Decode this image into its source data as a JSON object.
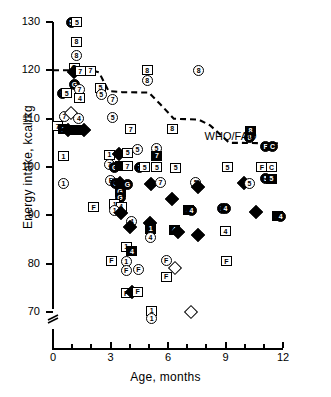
{
  "chart_data": {
    "type": "scatter",
    "title": "",
    "xlabel": "Age, months",
    "ylabel": "Energy intake, kcal/kg",
    "xlim": [
      0,
      12
    ],
    "ylim": [
      66,
      130
    ],
    "grid": false,
    "axis_break_y": true,
    "x_ticks_major": [
      0,
      3,
      6,
      9,
      12
    ],
    "x_ticks_minor": [
      1,
      2,
      4,
      5,
      7,
      8,
      10,
      11
    ],
    "y_ticks": [
      70,
      80,
      90,
      100,
      110,
      120,
      130
    ],
    "x_tick_labels": [
      "0",
      "3",
      "6",
      "9",
      "12"
    ],
    "y_tick_labels": [
      "70",
      "80",
      "90",
      "100",
      "110",
      "120",
      "130"
    ],
    "annotations": [
      {
        "text": "WHO/FAO",
        "x": 10.1,
        "y": 106.2
      }
    ],
    "reference_line": {
      "name": "WHO/FAO",
      "style": "dashed",
      "points": [
        [
          0.0,
          120.0
        ],
        [
          2.0,
          120.0
        ],
        [
          2.4,
          119.6
        ],
        [
          2.9,
          115.7
        ],
        [
          3.6,
          115.5
        ],
        [
          5.0,
          115.4
        ],
        [
          5.6,
          113.0
        ],
        [
          6.3,
          110.0
        ],
        [
          7.6,
          109.8
        ],
        [
          8.2,
          108.6
        ],
        [
          9.2,
          105.0
        ],
        [
          11.9,
          104.9
        ]
      ]
    },
    "marker_shapes": {
      "sq": "square",
      "ci": "circle",
      "di": "diamond"
    },
    "points": [
      {
        "x": 0.95,
        "y": 129.8,
        "shape": "ci",
        "label": "5",
        "filled": true
      },
      {
        "x": 1.25,
        "y": 129.9,
        "shape": "sq",
        "label": "5"
      },
      {
        "x": 1.22,
        "y": 125.9,
        "shape": "sq",
        "label": "8"
      },
      {
        "x": 1.22,
        "y": 123.0,
        "shape": "ci",
        "label": "8"
      },
      {
        "x": 1.1,
        "y": 120.5,
        "shape": "sq",
        "label": "G"
      },
      {
        "x": 1.12,
        "y": 119.7,
        "shape": "di",
        "label": "",
        "filled": true
      },
      {
        "x": 1.42,
        "y": 119.8,
        "shape": "sq",
        "label": "7"
      },
      {
        "x": 1.95,
        "y": 119.9,
        "shape": "sq",
        "label": "7"
      },
      {
        "x": 1.12,
        "y": 117.0,
        "shape": "ci",
        "label": "G",
        "filled": true
      },
      {
        "x": 0.5,
        "y": 115.3,
        "shape": "ci",
        "label": "5",
        "filled": true
      },
      {
        "x": 0.72,
        "y": 115.3,
        "shape": "sq",
        "label": "5"
      },
      {
        "x": 1.38,
        "y": 116.1,
        "shape": "ci",
        "label": "7"
      },
      {
        "x": 2.48,
        "y": 116.4,
        "shape": "sq",
        "label": "5"
      },
      {
        "x": 2.52,
        "y": 115.1,
        "shape": "ci",
        "label": "5"
      },
      {
        "x": 1.4,
        "y": 114.2,
        "shape": "sq",
        "label": "4"
      },
      {
        "x": 3.12,
        "y": 114.0,
        "shape": "ci",
        "label": "7"
      },
      {
        "x": 0.6,
        "y": 110.4,
        "shape": "ci",
        "label": "7"
      },
      {
        "x": 0.92,
        "y": 111.2,
        "shape": "di",
        "label": "",
        "filled": false
      },
      {
        "x": 3.12,
        "y": 110.3,
        "shape": "ci",
        "label": "5"
      },
      {
        "x": 1.35,
        "y": 110.1,
        "shape": "ci",
        "label": "4"
      },
      {
        "x": 0.25,
        "y": 108.4,
        "shape": "sq",
        "label": "7"
      },
      {
        "x": 0.55,
        "y": 107.8,
        "shape": "sq",
        "label": "1",
        "filled": true
      },
      {
        "x": 0.78,
        "y": 107.7,
        "shape": "di",
        "label": "",
        "filled": true
      },
      {
        "x": 1.05,
        "y": 107.6,
        "shape": "sq",
        "label": "",
        "filled": true
      },
      {
        "x": 1.3,
        "y": 107.6,
        "shape": "sq",
        "label": "",
        "filled": true
      },
      {
        "x": 1.6,
        "y": 107.6,
        "shape": "di",
        "label": "",
        "filled": true
      },
      {
        "x": 4.92,
        "y": 120.0,
        "shape": "sq",
        "label": "8"
      },
      {
        "x": 4.92,
        "y": 117.9,
        "shape": "ci",
        "label": "8"
      },
      {
        "x": 7.6,
        "y": 120.0,
        "shape": "ci",
        "label": "8"
      },
      {
        "x": 4.05,
        "y": 107.8,
        "shape": "sq",
        "label": "7"
      },
      {
        "x": 6.22,
        "y": 107.9,
        "shape": "sq",
        "label": "8"
      },
      {
        "x": 10.3,
        "y": 107.5,
        "shape": "sq",
        "label": "8",
        "filled": true
      },
      {
        "x": 10.25,
        "y": 106.1,
        "shape": "ci",
        "label": "8",
        "filled": true
      },
      {
        "x": 11.1,
        "y": 104.3,
        "shape": "ci",
        "label": "F",
        "filled": true
      },
      {
        "x": 11.45,
        "y": 104.3,
        "shape": "ci",
        "label": "C",
        "filled": true
      },
      {
        "x": 0.55,
        "y": 102.2,
        "shape": "sq",
        "label": "1"
      },
      {
        "x": 2.95,
        "y": 102.5,
        "shape": "sq",
        "label": "1"
      },
      {
        "x": 3.42,
        "y": 102.6,
        "shape": "di",
        "label": "",
        "filled": true
      },
      {
        "x": 3.9,
        "y": 103.0,
        "shape": "sq",
        "label": "5"
      },
      {
        "x": 4.4,
        "y": 103.6,
        "shape": "ci",
        "label": "5"
      },
      {
        "x": 5.4,
        "y": 103.9,
        "shape": "ci",
        "label": "5"
      },
      {
        "x": 5.42,
        "y": 102.3,
        "shape": "sq",
        "label": "7",
        "filled": true
      },
      {
        "x": 2.95,
        "y": 100.6,
        "shape": "ci",
        "label": "7"
      },
      {
        "x": 3.22,
        "y": 100.0,
        "shape": "ci",
        "label": "G",
        "filled": true
      },
      {
        "x": 3.52,
        "y": 100.3,
        "shape": "sq",
        "label": "",
        "filled": true
      },
      {
        "x": 3.88,
        "y": 100.2,
        "shape": "sq",
        "label": "7"
      },
      {
        "x": 4.52,
        "y": 99.9,
        "shape": "ci",
        "label": "7",
        "filled": true
      },
      {
        "x": 4.78,
        "y": 99.9,
        "shape": "sq",
        "label": "5"
      },
      {
        "x": 5.42,
        "y": 99.9,
        "shape": "sq",
        "label": "5"
      },
      {
        "x": 6.4,
        "y": 99.8,
        "shape": "sq",
        "label": "5"
      },
      {
        "x": 9.1,
        "y": 99.9,
        "shape": "sq",
        "label": "5"
      },
      {
        "x": 10.9,
        "y": 99.9,
        "shape": "sq",
        "label": "F"
      },
      {
        "x": 11.4,
        "y": 99.9,
        "shape": "sq",
        "label": "C"
      },
      {
        "x": 11.1,
        "y": 97.6,
        "shape": "ci",
        "label": "5",
        "filled": true
      },
      {
        "x": 11.4,
        "y": 97.6,
        "shape": "sq",
        "label": "5",
        "filled": true
      },
      {
        "x": 0.55,
        "y": 96.6,
        "shape": "ci",
        "label": "1"
      },
      {
        "x": 3.02,
        "y": 97.3,
        "shape": "ci",
        "label": "F"
      },
      {
        "x": 3.28,
        "y": 96.6,
        "shape": "ci",
        "label": "G",
        "filled": true
      },
      {
        "x": 3.52,
        "y": 96.7,
        "shape": "di",
        "label": "",
        "filled": true
      },
      {
        "x": 3.88,
        "y": 96.3,
        "shape": "ci",
        "label": "G",
        "filled": true
      },
      {
        "x": 5.1,
        "y": 96.5,
        "shape": "di",
        "label": "",
        "filled": true
      },
      {
        "x": 5.6,
        "y": 96.7,
        "shape": "ci",
        "label": "7"
      },
      {
        "x": 7.45,
        "y": 96.7,
        "shape": "ci",
        "label": "5"
      },
      {
        "x": 7.58,
        "y": 95.8,
        "shape": "di",
        "label": "",
        "filled": true
      },
      {
        "x": 9.95,
        "y": 96.6,
        "shape": "di",
        "label": "",
        "filled": true
      },
      {
        "x": 10.25,
        "y": 96.6,
        "shape": "ci",
        "label": "5"
      },
      {
        "x": 3.5,
        "y": 94.9,
        "shape": "sq",
        "label": "G",
        "filled": true
      },
      {
        "x": 3.5,
        "y": 93.7,
        "shape": "ci",
        "label": "G",
        "filled": true
      },
      {
        "x": 6.2,
        "y": 93.3,
        "shape": "di",
        "label": "",
        "filled": true
      },
      {
        "x": 2.12,
        "y": 91.7,
        "shape": "sq",
        "label": "F"
      },
      {
        "x": 3.22,
        "y": 92.3,
        "shape": "sq",
        "label": "1"
      },
      {
        "x": 3.55,
        "y": 91.8,
        "shape": "sq",
        "label": "4"
      },
      {
        "x": 3.22,
        "y": 90.9,
        "shape": "ci",
        "label": "1"
      },
      {
        "x": 3.55,
        "y": 90.4,
        "shape": "di",
        "label": "",
        "filled": true
      },
      {
        "x": 7.05,
        "y": 91.1,
        "shape": "sq",
        "label": "4",
        "filled": true
      },
      {
        "x": 7.22,
        "y": 91.1,
        "shape": "ci",
        "label": "4",
        "filled": true
      },
      {
        "x": 8.82,
        "y": 91.4,
        "shape": "ci",
        "label": "F",
        "filled": true
      },
      {
        "x": 9.0,
        "y": 91.4,
        "shape": "ci",
        "label": "4",
        "filled": true
      },
      {
        "x": 10.6,
        "y": 90.7,
        "shape": "di",
        "label": "",
        "filled": true
      },
      {
        "x": 11.72,
        "y": 89.8,
        "shape": "sq",
        "label": "4",
        "filled": true
      },
      {
        "x": 11.88,
        "y": 89.8,
        "shape": "ci",
        "label": "4",
        "filled": true
      },
      {
        "x": 4.1,
        "y": 88.7,
        "shape": "ci",
        "label": "4"
      },
      {
        "x": 4.02,
        "y": 87.6,
        "shape": "di",
        "label": "",
        "filled": true
      },
      {
        "x": 5.08,
        "y": 88.5,
        "shape": "di",
        "label": "",
        "filled": true
      },
      {
        "x": 5.1,
        "y": 87.2,
        "shape": "sq",
        "label": "1",
        "filled": true
      },
      {
        "x": 6.32,
        "y": 87.0,
        "shape": "sq",
        "label": "4",
        "filled": true
      },
      {
        "x": 6.5,
        "y": 86.6,
        "shape": "di",
        "label": "",
        "filled": true
      },
      {
        "x": 7.55,
        "y": 86.0,
        "shape": "di",
        "label": "",
        "filled": true
      },
      {
        "x": 5.08,
        "y": 85.5,
        "shape": "ci",
        "label": "4"
      },
      {
        "x": 9.0,
        "y": 86.7,
        "shape": "sq",
        "label": "4"
      },
      {
        "x": 3.82,
        "y": 83.5,
        "shape": "sq",
        "label": "1"
      },
      {
        "x": 4.12,
        "y": 82.6,
        "shape": "sq",
        "label": "4",
        "filled": true
      },
      {
        "x": 3.05,
        "y": 80.6,
        "shape": "sq",
        "label": "F"
      },
      {
        "x": 3.82,
        "y": 80.5,
        "shape": "ci",
        "label": "1"
      },
      {
        "x": 5.9,
        "y": 80.6,
        "shape": "ci",
        "label": "F"
      },
      {
        "x": 6.35,
        "y": 79.1,
        "shape": "di",
        "label": "",
        "filled": false
      },
      {
        "x": 9.05,
        "y": 80.5,
        "shape": "sq",
        "label": "F"
      },
      {
        "x": 3.82,
        "y": 78.6,
        "shape": "ci",
        "label": "F"
      },
      {
        "x": 4.45,
        "y": 78.8,
        "shape": "ci",
        "label": "F"
      },
      {
        "x": 5.9,
        "y": 77.3,
        "shape": "sq",
        "label": "F"
      },
      {
        "x": 3.82,
        "y": 73.9,
        "shape": "sq",
        "label": "F"
      },
      {
        "x": 4.12,
        "y": 74.2,
        "shape": "di",
        "label": "",
        "filled": true
      },
      {
        "x": 4.42,
        "y": 74.2,
        "shape": "sq",
        "label": "F"
      },
      {
        "x": 5.15,
        "y": 70.3,
        "shape": "sq",
        "label": "1"
      },
      {
        "x": 7.2,
        "y": 70.1,
        "shape": "di",
        "label": "",
        "filled": false
      },
      {
        "x": 5.15,
        "y": 68.6,
        "shape": "ci",
        "label": "1"
      }
    ]
  }
}
